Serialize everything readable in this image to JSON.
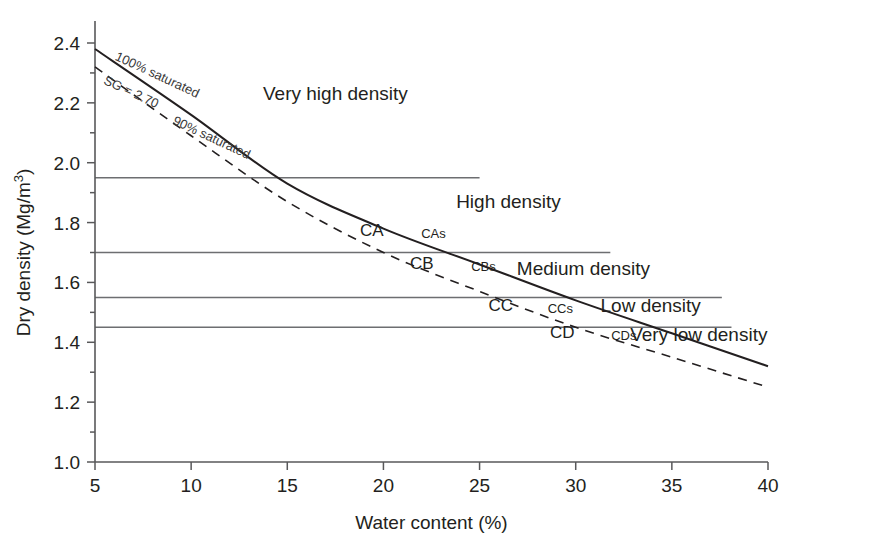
{
  "chart_data": {
    "type": "line",
    "title": "",
    "xlabel": "Water content (%)",
    "ylabel": "Dry density (Mg/m3)",
    "ylabel_display": "Dry density (Mg/m",
    "ylabel_sup": "3",
    "ylabel_tail": ")",
    "xlim": [
      5,
      40
    ],
    "ylim": [
      1.0,
      2.4
    ],
    "xticks": [
      5,
      10,
      15,
      20,
      25,
      30,
      35,
      40
    ],
    "xtick_labels": [
      "5",
      "10",
      "15",
      "20",
      "25",
      "30",
      "35",
      "40"
    ],
    "yticks": [
      1.0,
      1.2,
      1.4,
      1.6,
      1.8,
      2.0,
      2.2,
      2.4
    ],
    "ytick_labels": [
      "1.0",
      "1.2",
      "1.4",
      "1.6",
      "1.8",
      "2.0",
      "2.2",
      "2.4"
    ],
    "grid": false,
    "legend_position": "inline-curve-labels",
    "series": [
      {
        "name": "100% saturated",
        "style": "solid",
        "sg": 2.7,
        "points": [
          {
            "x": 5,
            "y": 2.38
          },
          {
            "x": 10,
            "y": 2.16
          },
          {
            "x": 15,
            "y": 1.93
          },
          {
            "x": 20,
            "y": 1.78
          },
          {
            "x": 25,
            "y": 1.66
          },
          {
            "x": 30,
            "y": 1.54
          },
          {
            "x": 35,
            "y": 1.43
          },
          {
            "x": 40,
            "y": 1.32
          }
        ]
      },
      {
        "name": "90% saturated",
        "style": "dashed",
        "sg": 2.7,
        "points": [
          {
            "x": 5,
            "y": 2.32
          },
          {
            "x": 10,
            "y": 2.09
          },
          {
            "x": 15,
            "y": 1.87
          },
          {
            "x": 20,
            "y": 1.7
          },
          {
            "x": 25,
            "y": 1.57
          },
          {
            "x": 30,
            "y": 1.45
          },
          {
            "x": 35,
            "y": 1.35
          },
          {
            "x": 40,
            "y": 1.25
          }
        ]
      }
    ],
    "curve_annotations": [
      {
        "label": "100% saturated",
        "x": 6.0,
        "y": 2.345
      },
      {
        "label": "SG = 2.70",
        "x": 5.4,
        "y": 2.265
      },
      {
        "label": "90% saturated",
        "x": 9.0,
        "y": 2.13
      }
    ],
    "density_dividers": [
      {
        "value": 1.95,
        "x_start": 5,
        "x_end": 25.0
      },
      {
        "value": 1.7,
        "x_start": 5,
        "x_end": 31.8
      },
      {
        "value": 1.55,
        "x_start": 5,
        "x_end": 37.6
      },
      {
        "value": 1.45,
        "x_start": 5,
        "x_end": 38.1
      }
    ],
    "region_labels": [
      {
        "label": "Very high density",
        "x": 17.5,
        "y": 2.21
      },
      {
        "label": "High density",
        "x": 26.5,
        "y": 1.85
      },
      {
        "label": "Medium density",
        "x": 30.4,
        "y": 1.625
      },
      {
        "label": "Low density",
        "x": 33.9,
        "y": 1.5
      },
      {
        "label": "Very low density",
        "x": 36.4,
        "y": 1.405
      }
    ],
    "class_labels": [
      {
        "label": "CA",
        "x": 19.4,
        "y": 1.755,
        "size": "large"
      },
      {
        "label": "CAs",
        "x": 22.6,
        "y": 1.748,
        "size": "small"
      },
      {
        "label": "CB",
        "x": 22.0,
        "y": 1.645,
        "size": "large"
      },
      {
        "label": "CBs",
        "x": 25.2,
        "y": 1.638,
        "size": "small"
      },
      {
        "label": "CC",
        "x": 26.1,
        "y": 1.505,
        "size": "large"
      },
      {
        "label": "CCs",
        "x": 29.2,
        "y": 1.498,
        "size": "small"
      },
      {
        "label": "CD",
        "x": 29.3,
        "y": 1.415,
        "size": "large"
      },
      {
        "label": "CDs",
        "x": 32.5,
        "y": 1.408,
        "size": "small"
      }
    ],
    "colors": {
      "axis": "#58585a",
      "divider": "#6d6e71",
      "curve": "#231f20",
      "text": "#231f20",
      "background": "#ffffff"
    }
  }
}
